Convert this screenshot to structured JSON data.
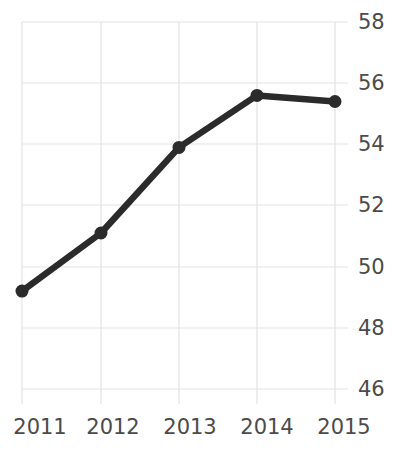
{
  "chart_data": {
    "type": "line",
    "title": "",
    "title_clipped": true,
    "xlabel": "",
    "ylabel": "",
    "categories": [
      "2011",
      "2012",
      "2013",
      "2014",
      "2015"
    ],
    "x": [
      2011,
      2012,
      2013,
      2014,
      2015
    ],
    "values": [
      49.2,
      51.1,
      53.9,
      55.6,
      55.4
    ],
    "series": [
      {
        "name": "",
        "values": [
          49.2,
          51.1,
          53.9,
          55.6,
          55.4
        ]
      }
    ],
    "ylim": [
      45.3,
      58.7
    ],
    "y_ticks": [
      46,
      48,
      50,
      52,
      54,
      56,
      58
    ],
    "y_tick_labels": [
      "46",
      "48",
      "50",
      "52",
      "54",
      "56",
      "58"
    ],
    "y_axis_position": "right",
    "x_tick_labels": [
      "2011",
      "2012",
      "2013",
      "2014",
      "2015"
    ],
    "grid": true,
    "grid_x": true,
    "grid_y": true,
    "legend": false,
    "legend_position": "none",
    "markers": true,
    "colors": {
      "line": "#2b2b2b",
      "marker": "#2b2b2b",
      "grid": "#e3e3e5",
      "text": "#4b4b4b",
      "background": "#ffffff"
    }
  }
}
